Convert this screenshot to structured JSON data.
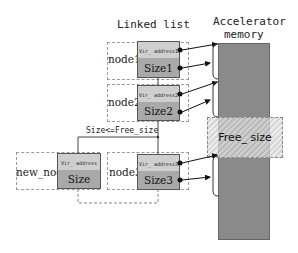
{
  "diagram": {
    "title": "Linked list",
    "memory_label_line1": "Accelerator",
    "memory_label_line2": "memory",
    "free_label": "Free_ size",
    "condition_label": "Size<=Free_size",
    "nodes": [
      {
        "name": "node1",
        "addr": "Vir_ address1",
        "size": "Size1"
      },
      {
        "name": "node2",
        "addr": "Vir_ address2",
        "size": "Size2"
      },
      {
        "name": "node3",
        "addr": "Vir_ address3",
        "size": "Size3"
      },
      {
        "name": "new_node",
        "addr": "Vir_ address",
        "size": "Size"
      }
    ],
    "colors": {
      "addr_cell": "#cfcfcf",
      "size_cell": "#a9a9a9",
      "memory": "#8a8a8a",
      "dashed_border": "#9a9a9a"
    }
  }
}
